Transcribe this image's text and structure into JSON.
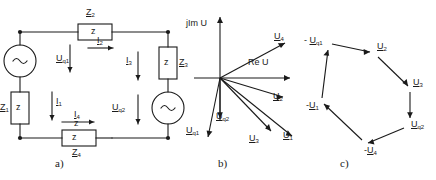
{
  "figure": {
    "panels": [
      {
        "id": "a",
        "caption": "a)",
        "title": "circuit-schematic"
      },
      {
        "id": "b",
        "caption": "b)",
        "title": "phasor-diagram"
      },
      {
        "id": "c",
        "caption": "c)",
        "title": "voltage-polygon"
      }
    ]
  },
  "circuit": {
    "sources": [
      {
        "name": "source-uq1",
        "label": "U",
        "sub": "q1",
        "symbol": "~",
        "position": "left-branch",
        "arrow": "down"
      },
      {
        "name": "source-uq2",
        "label": "U",
        "sub": "q2",
        "symbol": "~",
        "position": "right-branch",
        "arrow": "down"
      }
    ],
    "impedances": [
      {
        "name": "Z1",
        "label": "Z",
        "sub": "1",
        "inner": "z",
        "orientation": "vertical",
        "position": "left-lower"
      },
      {
        "name": "Z2",
        "label": "Z",
        "sub": "2",
        "inner": "z",
        "orientation": "horizontal",
        "position": "top"
      },
      {
        "name": "Z3",
        "label": "Z",
        "sub": "3",
        "inner": "z",
        "orientation": "vertical",
        "position": "right-upper"
      },
      {
        "name": "Z4",
        "label": "Z",
        "sub": "4",
        "inner": "z",
        "orientation": "horizontal",
        "position": "bottom"
      }
    ],
    "currents": [
      {
        "name": "I1",
        "label": "I",
        "sub": "1",
        "direction": "down",
        "position": "left-branch"
      },
      {
        "name": "I2",
        "label": "I",
        "sub": "2",
        "direction": "right",
        "position": "top-branch"
      },
      {
        "name": "I3",
        "label": "I",
        "sub": "3",
        "direction": "down",
        "position": "right-branch"
      },
      {
        "name": "I4",
        "label": "I",
        "sub": "4",
        "direction": "right",
        "position": "bottom-branch"
      }
    ]
  },
  "phasor_diagram": {
    "axes": {
      "imaginary": {
        "text": "jIm U",
        "direction": "up"
      },
      "real": {
        "text": "Re U",
        "direction": "right"
      }
    },
    "vectors": [
      {
        "name": "U4",
        "label": "U",
        "sub": "4",
        "angle_deg": 28,
        "length": 74
      },
      {
        "name": "U2",
        "label": "U",
        "sub": "2",
        "angle_deg": -17,
        "length": 66
      },
      {
        "name": "U3",
        "label": "U",
        "sub": "3",
        "angle_deg": -46,
        "length": 74
      },
      {
        "name": "U1",
        "label": "U",
        "sub": "1",
        "angle_deg": -37,
        "length": 96
      },
      {
        "name": "Uq1",
        "label": "U",
        "sub": "q1",
        "angle_deg": -76,
        "length": 62
      },
      {
        "name": "Uq2",
        "label": "U",
        "sub": "q2",
        "angle_deg": -90,
        "length": 42
      }
    ]
  },
  "voltage_polygon": {
    "vertices": [
      {
        "name": "-Uq1",
        "label": "- U",
        "sub": "q1"
      },
      {
        "name": "U2",
        "label": "U",
        "sub": "2"
      },
      {
        "name": "U3",
        "label": "U",
        "sub": "3"
      },
      {
        "name": "Uq2",
        "label": "U",
        "sub": "q2"
      },
      {
        "name": "-U4",
        "label": "-U",
        "sub": "4"
      },
      {
        "name": "-U1",
        "label": "-U",
        "sub": "1"
      }
    ],
    "order": "-Uq1 -> U2 -> U3 -> Uq2 -> -U4 -> -U1 -> -Uq1",
    "closed": true
  },
  "style": {
    "stroke": "#1a1a1a",
    "background": "#ffffff"
  }
}
